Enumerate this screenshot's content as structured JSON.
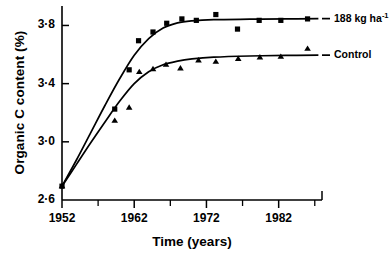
{
  "chart_data": {
    "type": "scatter",
    "title": "",
    "xlabel": "Time (years)",
    "ylabel": "Organic C content (%)",
    "xlim": [
      1952,
      1988
    ],
    "ylim": [
      2.6,
      3.92
    ],
    "xticks": [
      1952,
      1962,
      1972,
      1982
    ],
    "xticklabels": [
      "1952",
      "1962",
      "1972",
      "1982"
    ],
    "xminorticks": [
      1957,
      1967,
      1977,
      1987
    ],
    "yticks": [
      2.6,
      3.0,
      3.4,
      3.8
    ],
    "yticklabels": [
      "2·6",
      "3·0",
      "3·4",
      "3·8"
    ],
    "grid": false,
    "legend_position": "right",
    "series": [
      {
        "name": "188 kg ha⁻¹",
        "label_text": "188 kg ha",
        "label_sup": "-1",
        "marker": "square",
        "color": "#000000",
        "points": [
          {
            "x": 1952.0,
            "y": 2.695
          },
          {
            "x": 1959.3,
            "y": 3.225
          },
          {
            "x": 1961.3,
            "y": 3.495
          },
          {
            "x": 1962.6,
            "y": 3.695
          },
          {
            "x": 1964.6,
            "y": 3.755
          },
          {
            "x": 1966.5,
            "y": 3.815
          },
          {
            "x": 1968.6,
            "y": 3.845
          },
          {
            "x": 1970.6,
            "y": 3.835
          },
          {
            "x": 1973.3,
            "y": 3.875
          },
          {
            "x": 1976.3,
            "y": 3.775
          },
          {
            "x": 1979.3,
            "y": 3.835
          },
          {
            "x": 1982.3,
            "y": 3.835
          },
          {
            "x": 1986.0,
            "y": 3.845
          }
        ],
        "fit": [
          {
            "x": 1952.0,
            "y": 2.695
          },
          {
            "x": 1954.0,
            "y": 2.875
          },
          {
            "x": 1956.0,
            "y": 3.065
          },
          {
            "x": 1958.0,
            "y": 3.255
          },
          {
            "x": 1960.0,
            "y": 3.435
          },
          {
            "x": 1962.0,
            "y": 3.595
          },
          {
            "x": 1964.0,
            "y": 3.71
          },
          {
            "x": 1966.0,
            "y": 3.782
          },
          {
            "x": 1968.0,
            "y": 3.818
          },
          {
            "x": 1970.0,
            "y": 3.832
          },
          {
            "x": 1973.0,
            "y": 3.84
          },
          {
            "x": 1978.0,
            "y": 3.843
          },
          {
            "x": 1983.0,
            "y": 3.845
          },
          {
            "x": 1987.5,
            "y": 3.847
          }
        ]
      },
      {
        "name": "Control",
        "label_text": "Control",
        "label_sup": "",
        "marker": "triangle",
        "color": "#000000",
        "points": [
          {
            "x": 1952.0,
            "y": 2.695
          },
          {
            "x": 1959.3,
            "y": 3.145
          },
          {
            "x": 1961.3,
            "y": 3.235
          },
          {
            "x": 1962.7,
            "y": 3.48
          },
          {
            "x": 1964.6,
            "y": 3.5
          },
          {
            "x": 1966.4,
            "y": 3.53
          },
          {
            "x": 1968.4,
            "y": 3.505
          },
          {
            "x": 1970.9,
            "y": 3.56
          },
          {
            "x": 1973.3,
            "y": 3.55
          },
          {
            "x": 1976.4,
            "y": 3.57
          },
          {
            "x": 1979.4,
            "y": 3.58
          },
          {
            "x": 1982.3,
            "y": 3.585
          },
          {
            "x": 1986.0,
            "y": 3.64
          }
        ],
        "fit": [
          {
            "x": 1952.0,
            "y": 2.695
          },
          {
            "x": 1954.0,
            "y": 2.845
          },
          {
            "x": 1956.0,
            "y": 2.995
          },
          {
            "x": 1958.0,
            "y": 3.14
          },
          {
            "x": 1960.0,
            "y": 3.28
          },
          {
            "x": 1962.0,
            "y": 3.4
          },
          {
            "x": 1964.0,
            "y": 3.482
          },
          {
            "x": 1966.0,
            "y": 3.53
          },
          {
            "x": 1968.0,
            "y": 3.555
          },
          {
            "x": 1970.0,
            "y": 3.57
          },
          {
            "x": 1973.0,
            "y": 3.582
          },
          {
            "x": 1978.0,
            "y": 3.59
          },
          {
            "x": 1983.0,
            "y": 3.594
          },
          {
            "x": 1987.5,
            "y": 3.596
          }
        ]
      }
    ]
  },
  "legend": {
    "items": [
      {
        "label": "188 kg ha",
        "sup": "-1"
      },
      {
        "label": "Control",
        "sup": ""
      }
    ]
  }
}
